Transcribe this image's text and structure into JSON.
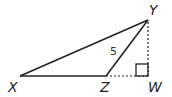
{
  "diagram": {
    "type": "geometry-triangle",
    "points": {
      "X": {
        "label": "X",
        "x": 20,
        "y": 76
      },
      "Z": {
        "label": "Z",
        "x": 106,
        "y": 76
      },
      "W": {
        "label": "W",
        "x": 148,
        "y": 76
      },
      "Y": {
        "label": "Y",
        "x": 148,
        "y": 20
      }
    },
    "segments": [
      {
        "from": "X",
        "to": "Y",
        "style": "solid"
      },
      {
        "from": "X",
        "to": "Z",
        "style": "solid"
      },
      {
        "from": "Z",
        "to": "Y",
        "style": "solid",
        "length_label": "5"
      },
      {
        "from": "Z",
        "to": "W",
        "style": "dashed"
      },
      {
        "from": "W",
        "to": "Y",
        "style": "dashed"
      }
    ],
    "right_angle_at": "W",
    "side_label_ZY": "5",
    "colors": {
      "line": "#222222",
      "background": "#ffffff"
    }
  }
}
